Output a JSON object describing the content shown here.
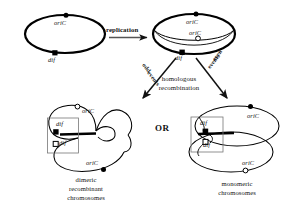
{
  "figure": {
    "domain": "biology-diagram",
    "title_visible": false,
    "background_color": "#ffffff",
    "stroke_color": "#000000",
    "text_color": "#111111"
  },
  "legend_markers": {
    "filled_circle": "oriC (filled circle)",
    "open_circle": "oriC (open circle)",
    "filled_square": "dif (filled square)",
    "open_square": "dif (open square)"
  },
  "panels": {
    "parent": {
      "name": "parental-chromosome",
      "oric_label": "oriC",
      "dif_label": "dif"
    },
    "theta": {
      "name": "replicating-chromosome",
      "oric_label_top": "oriC",
      "oric_label_inner": "oriC",
      "dif_label": "dif"
    },
    "dimer": {
      "name": "dimeric-chromosome",
      "oric_label_upper": "oriC",
      "oric_label_lower": "oriC",
      "dif_label_upper": "dif",
      "dif_label_lower": "dif",
      "caption_line1": "dimeric",
      "caption_line2": "recombinant",
      "caption_line3": "chromosomes"
    },
    "monomer": {
      "name": "monomeric-chromosomes",
      "oric_label_upper": "oriC",
      "oric_label_lower": "oriC",
      "dif_label_upper": "dif",
      "dif_label_lower": "dif",
      "caption_line1": "monomeric",
      "caption_line2": "chromosomes"
    }
  },
  "arrows": {
    "replication_label": "replication",
    "odd_events_line1": "odd",
    "odd_events_line2": "events",
    "even_events_line1": "even",
    "even_events_line2": "events",
    "homologous_line1": "homologous",
    "homologous_line2": "recombination",
    "or_label": "OR"
  }
}
